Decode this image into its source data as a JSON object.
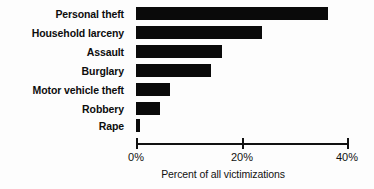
{
  "chart_data": {
    "type": "bar",
    "orientation": "horizontal",
    "title": "",
    "xlabel": "Percent of all victimizations",
    "ylabel": "",
    "xlim": [
      0,
      40
    ],
    "xticks": [
      0,
      20,
      40
    ],
    "xtick_labels": [
      "0%",
      "20%",
      "40%"
    ],
    "grid": false,
    "legend": null,
    "bar_color": "#0a0a0a",
    "categories": [
      "Personal theft",
      "Household larceny",
      "Assault",
      "Burglary",
      "Motor vehicle theft",
      "Robbery",
      "Rape"
    ],
    "values": [
      36.4,
      23.9,
      16.3,
      14.3,
      6.5,
      4.5,
      0.8
    ]
  }
}
